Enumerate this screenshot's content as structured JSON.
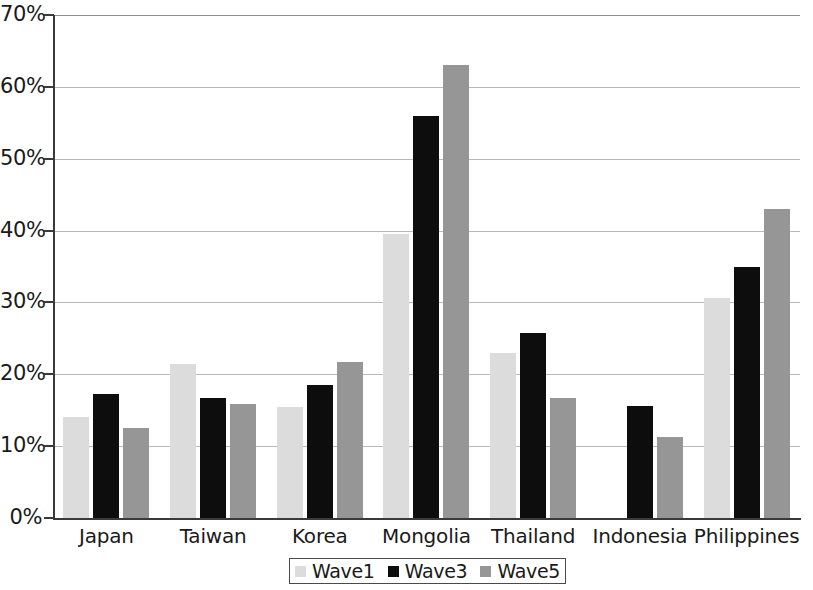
{
  "chart_data": {
    "type": "bar",
    "title": "",
    "subtitle": "",
    "xlabel": "",
    "ylabel": "",
    "ylim": [
      0,
      70
    ],
    "y_tick_labels": [
      "0%",
      "10%",
      "20%",
      "30%",
      "40%",
      "50%",
      "60%",
      "70%"
    ],
    "y_tick_values": [
      0,
      10,
      20,
      30,
      40,
      50,
      60,
      70
    ],
    "grid": true,
    "legend_position": "bottom",
    "categories": [
      "Japan",
      "Taiwan",
      "Korea",
      "Mongolia",
      "Thailand",
      "Indonesia",
      "Philippines"
    ],
    "series": [
      {
        "name": "Wave1",
        "color": "#dcdcdc",
        "values": [
          14.0,
          21.5,
          15.5,
          39.5,
          22.9,
          null,
          30.6
        ]
      },
      {
        "name": "Wave3",
        "color": "#0d0d0d",
        "values": [
          17.2,
          16.7,
          18.5,
          56.0,
          25.7,
          15.6,
          35.0
        ]
      },
      {
        "name": "Wave5",
        "color": "#969696",
        "values": [
          12.5,
          15.8,
          21.7,
          63.0,
          16.7,
          11.3,
          43.0
        ]
      }
    ]
  },
  "legend": {
    "items": [
      {
        "label": "Wave1",
        "swatch": "w1"
      },
      {
        "label": "Wave3",
        "swatch": "w3"
      },
      {
        "label": "Wave5",
        "swatch": "w5"
      }
    ]
  },
  "colors": {
    "wave1": "#dcdcdc",
    "wave3": "#0d0d0d",
    "wave5": "#969696",
    "axis": "#3a3a3a",
    "gridline": "#b9b9b9",
    "background": "#ffffff"
  }
}
